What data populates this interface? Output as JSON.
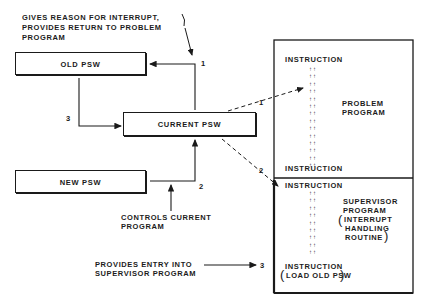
{
  "diagram": {
    "annotations": {
      "gives_reason_line1": "GIVES REASON FOR INTERRUPT,",
      "gives_reason_line2": "PROVIDES RETURN TO PROBLEM",
      "gives_reason_line3": "PROGRAM",
      "controls_line1": "CONTROLS CURRENT",
      "controls_line2": "PROGRAM",
      "entry_line1": "PROVIDES ENTRY INTO",
      "entry_line2": "SUPERVISOR PROGRAM"
    },
    "boxes": {
      "old_psw": "OLD PSW",
      "current_psw": "CURRENT PSW",
      "new_psw": "NEW PSW"
    },
    "step_numbers": {
      "old_to_current": "3",
      "current_to_old": "1",
      "new_to_current": "2",
      "dashed_to_problem": "1",
      "dashed_to_supervisor": "2",
      "entry_arrow": "3"
    },
    "memory": {
      "problem_section": {
        "top_instruction": "INSTRUCTION",
        "label_line1": "PROBLEM",
        "label_line2": "PROGRAM",
        "bottom_instruction": "INSTRUCTION"
      },
      "supervisor_section": {
        "top_instruction": "INSTRUCTION",
        "label_line1": "SUPERVISOR",
        "label_line2": "PROGRAM",
        "label_line3": "INTERRUPT",
        "label_line4": "HANDLING",
        "label_line5": "ROUTINE",
        "bottom_instruction": "INSTRUCTION",
        "bottom_note": "LOAD OLD PSW"
      },
      "dot_marks": "↑↑"
    }
  }
}
